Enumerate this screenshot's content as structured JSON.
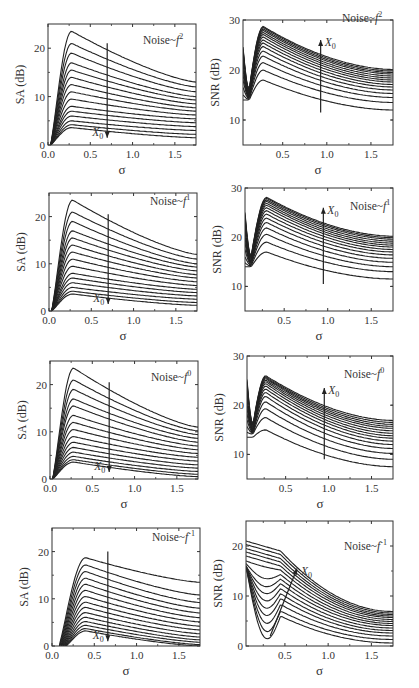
{
  "figure": {
    "xlabel": "σ",
    "arrow_label": "X",
    "arrow_sub": "0"
  },
  "chart_data": [
    {
      "type": "line",
      "panel": "SA f^2",
      "title": "Noise~f",
      "exponent": "2",
      "ylabel": "SA (dB)",
      "xlim": [
        0,
        1.75
      ],
      "ylim": [
        0,
        25
      ],
      "xticks": [
        "0.0",
        "0.5",
        "1.0",
        "1.5"
      ],
      "yticks": [
        "0",
        "10",
        "20"
      ],
      "arrow": {
        "x": 0.7,
        "from": 21,
        "to": 1.5,
        "direction": "down"
      },
      "n_curves": 15,
      "peaks": [
        23.5,
        21,
        19,
        17,
        15.5,
        14,
        12.5,
        11,
        9.5,
        8,
        7,
        6,
        5,
        4.2,
        3.6
      ],
      "peak_x": 0.28,
      "end_values": [
        13,
        12,
        11,
        10,
        9.3,
        8.5,
        7.7,
        7,
        6.2,
        5.4,
        4.6,
        3.8,
        3,
        2.2,
        1.5
      ]
    },
    {
      "type": "line",
      "panel": "SNR f^2",
      "title": "Noise~f",
      "exponent": "2",
      "ylabel": "SNR (dB)",
      "xlim": [
        0.05,
        1.75
      ],
      "ylim": [
        5,
        30
      ],
      "xticks": [
        "0.5",
        "1.0",
        "1.5"
      ],
      "yticks": [
        "10",
        "20",
        "30"
      ],
      "arrow": {
        "x": 0.93,
        "from": 11.5,
        "to": 26,
        "direction": "up"
      },
      "n_curves": 15,
      "start_values": [
        14,
        15,
        16.5,
        18,
        19,
        20,
        21,
        21.7,
        22.3,
        22.8,
        23.2,
        23.6,
        24,
        24.3,
        24.6
      ],
      "peaks": [
        18,
        20,
        21.5,
        22.8,
        23.8,
        24.7,
        25.4,
        26,
        26.6,
        27.1,
        27.5,
        27.9,
        28.2,
        28.5,
        28.7
      ],
      "peak_x": 0.28,
      "end_values": [
        12,
        13.5,
        14.5,
        15.3,
        16,
        16.6,
        17.1,
        17.6,
        18,
        18.4,
        18.8,
        19.2,
        19.5,
        19.8,
        20.1
      ]
    },
    {
      "type": "line",
      "panel": "SA f^1",
      "title": "Noise~f",
      "exponent": "1",
      "ylabel": "SA (dB)",
      "xlim": [
        0,
        1.75
      ],
      "ylim": [
        0,
        25
      ],
      "xticks": [
        "0.0",
        "0.5",
        "1.0",
        "1.5"
      ],
      "yticks": [
        "0",
        "10",
        "20"
      ],
      "arrow": {
        "x": 0.7,
        "from": 20.5,
        "to": 1.5,
        "direction": "down"
      },
      "n_curves": 15,
      "peaks": [
        23.5,
        21,
        19,
        17,
        15.5,
        14,
        12.5,
        11,
        9.5,
        8,
        7,
        6,
        5,
        4.2,
        3.6
      ],
      "peak_x": 0.28,
      "end_values": [
        12,
        11,
        10,
        9.3,
        8.5,
        7.7,
        7,
        6.2,
        5.4,
        4.6,
        3.9,
        3.2,
        2.5,
        1.8,
        1.2
      ]
    },
    {
      "type": "line",
      "panel": "SNR f^1",
      "title": "Noise~f",
      "exponent": "1",
      "ylabel": "SNR (dB)",
      "xlim": [
        0.05,
        1.75
      ],
      "ylim": [
        5,
        30
      ],
      "xticks": [
        "0.5",
        "1.0",
        "1.5"
      ],
      "yticks": [
        "10",
        "20",
        "30"
      ],
      "arrow": {
        "x": 0.95,
        "from": 10.5,
        "to": 26,
        "direction": "up"
      },
      "n_curves": 15,
      "start_values": [
        14,
        14.8,
        16,
        17.5,
        18.8,
        19.8,
        20.7,
        21.5,
        22.2,
        22.8,
        23.3,
        23.8,
        24.2,
        24.6,
        25
      ],
      "peaks": [
        17,
        19,
        20.6,
        21.9,
        23,
        23.9,
        24.7,
        25.4,
        26,
        26.5,
        26.9,
        27.3,
        27.6,
        27.9,
        28.1
      ],
      "peak_x": 0.3,
      "end_values": [
        11.5,
        13,
        14,
        14.9,
        15.7,
        16.4,
        17,
        17.5,
        18,
        18.4,
        18.8,
        19.2,
        19.6,
        19.9,
        20.2
      ]
    },
    {
      "type": "line",
      "panel": "SA f^0",
      "title": "Noise~f",
      "exponent": "0",
      "ylabel": "SA (dB)",
      "xlim": [
        0,
        1.75
      ],
      "ylim": [
        0,
        25
      ],
      "xticks": [
        "0.0",
        "0.5",
        "1.0",
        "1.5"
      ],
      "yticks": [
        "0",
        "10",
        "20"
      ],
      "arrow": {
        "x": 0.7,
        "from": 20.5,
        "to": 1.5,
        "direction": "down"
      },
      "n_curves": 15,
      "peaks": [
        23.5,
        21,
        19,
        17,
        15.5,
        13.5,
        12,
        10.5,
        9,
        7.8,
        6.7,
        5.7,
        4.8,
        4.1,
        3.6
      ],
      "peak_x": 0.28,
      "end_values": [
        11,
        10.2,
        9.4,
        8.6,
        7.8,
        7,
        6.2,
        5.4,
        4.6,
        3.8,
        3,
        2.3,
        1.6,
        1,
        0.5
      ]
    },
    {
      "type": "line",
      "panel": "SNR f^0",
      "title": "Noise~f",
      "exponent": "0",
      "ylabel": "SNR (dB)",
      "xlim": [
        0.05,
        1.75
      ],
      "ylim": [
        5,
        30
      ],
      "xticks": [
        "0.5",
        "1.0",
        "1.5"
      ],
      "yticks": [
        "10",
        "20",
        "30"
      ],
      "arrow": {
        "x": 0.95,
        "from": 9,
        "to": 23.5,
        "direction": "up"
      },
      "n_curves": 15,
      "start_values": [
        13.5,
        14.5,
        15.7,
        17,
        18.2,
        19.3,
        20.3,
        21.2,
        22,
        22.7,
        23.3,
        23.9,
        24.4,
        24.8,
        25.2
      ],
      "peaks": [
        15,
        17.5,
        19.3,
        20.7,
        21.8,
        22.6,
        23.3,
        23.9,
        24.4,
        24.8,
        25.1,
        25.4,
        25.6,
        25.8,
        26
      ],
      "peak_x": 0.27,
      "end_values": [
        7.5,
        9,
        10.2,
        11.2,
        12,
        12.7,
        13.3,
        13.8,
        14.3,
        14.8,
        15.3,
        15.7,
        16.1,
        16.5,
        16.9
      ]
    },
    {
      "type": "line",
      "panel": "SA f^-1",
      "title": "Noise~f",
      "exponent": "-1",
      "ylabel": "SA (dB)",
      "xlim": [
        0,
        1.75
      ],
      "ylim": [
        0,
        25
      ],
      "xticks": [
        "0.0",
        "0.5",
        "1.0",
        "1.5"
      ],
      "yticks": [
        "0",
        "10",
        "20"
      ],
      "arrow": {
        "x": 0.66,
        "from": 20,
        "to": 1,
        "direction": "down"
      },
      "n_curves": 15,
      "peaks": [
        18.7,
        17.2,
        15.8,
        14.4,
        13.1,
        11.8,
        10.5,
        9.3,
        8.2,
        7.1,
        6.1,
        5.2,
        4.4,
        3.7,
        3.2
      ],
      "peak_x": 0.4,
      "end_values": [
        13.5,
        10.8,
        9.2,
        8,
        7,
        6,
        5.1,
        4.2,
        3.4,
        2.6,
        1.9,
        1.3,
        0.8,
        0.3,
        0
      ]
    },
    {
      "type": "line",
      "panel": "SNR f^-1",
      "title": "Noise~f",
      "exponent": "-1",
      "ylabel": "SNR (dB)",
      "xlim": [
        0.05,
        1.75
      ],
      "ylim": [
        0,
        25
      ],
      "xticks": [
        "0.5",
        "1.0",
        "1.5"
      ],
      "yticks": [
        "0",
        "10",
        "20"
      ],
      "arrow": {
        "x0": 0.33,
        "y0": 2,
        "x1": 0.64,
        "y1": 15.5,
        "direction": "up-right"
      },
      "n_curves": 15,
      "start_values": [
        16,
        16,
        16,
        16,
        16,
        16,
        16,
        16,
        16.5,
        17,
        18,
        18.8,
        19.5,
        20.3,
        21
      ],
      "mid_values": [
        6,
        7,
        8.3,
        9.5,
        10.5,
        11.5,
        12.5,
        13.4,
        14.3,
        15.2,
        16,
        16.8,
        17.5,
        18.3,
        19
      ],
      "end_values": [
        0.6,
        1.3,
        2,
        2.6,
        3.1,
        3.6,
        4.1,
        4.5,
        4.9,
        5.3,
        5.7,
        6,
        6.3,
        6.6,
        6.9
      ]
    }
  ]
}
